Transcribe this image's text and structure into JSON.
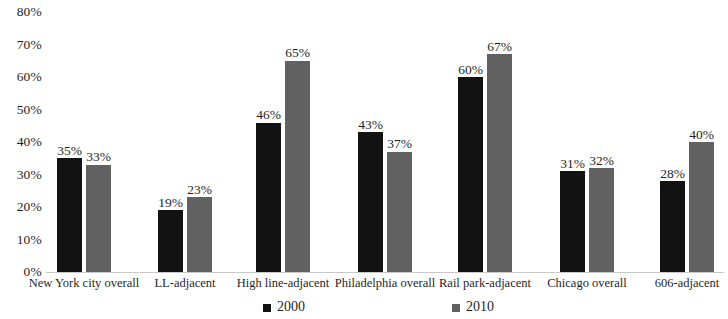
{
  "chart_data": {
    "type": "bar",
    "title": "",
    "subtitle": "",
    "xlabel": "",
    "ylabel": "",
    "ylim": [
      0,
      80
    ],
    "grid": false,
    "legend_position": "bottom",
    "y_ticks": [
      "0%",
      "10%",
      "20%",
      "30%",
      "40%",
      "50%",
      "60%",
      "70%",
      "80%"
    ],
    "y_tick_values": [
      0,
      10,
      20,
      30,
      40,
      50,
      60,
      70,
      80
    ],
    "categories": [
      "New York city overall",
      "LL-adjacent",
      "High line-adjacent",
      "Philadelphia overall",
      "Rail park-adjacent",
      "Chicago overall",
      "606-adjacent"
    ],
    "series": [
      {
        "name": "2000",
        "color": "#121212",
        "values": [
          35,
          19,
          46,
          43,
          60,
          31,
          28
        ],
        "labels": [
          "35%",
          "19%",
          "46%",
          "43%",
          "60%",
          "31%",
          "28%"
        ]
      },
      {
        "name": "2010",
        "color": "#616161",
        "values": [
          33,
          23,
          65,
          37,
          67,
          32,
          40
        ],
        "labels": [
          "33%",
          "23%",
          "65%",
          "37%",
          "67%",
          "32%",
          "40%"
        ]
      }
    ]
  },
  "legend": {
    "items": [
      {
        "label": "2000",
        "color": "#121212"
      },
      {
        "label": "2010",
        "color": "#616161"
      }
    ]
  }
}
